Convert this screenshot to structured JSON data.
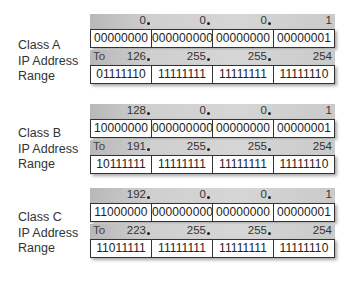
{
  "classes": [
    {
      "name": "Class A",
      "label_lines": [
        "Class A",
        "IP Address",
        "Range"
      ],
      "start": {
        "octets": [
          "0",
          "0",
          "0",
          "1"
        ],
        "binary": [
          "00000000",
          "000000000",
          "00000000",
          "00000001"
        ]
      },
      "to_label": "To",
      "end": {
        "octets": [
          "126",
          "255",
          "255",
          "254"
        ],
        "binary": [
          "01111110",
          "11111111",
          "11111111",
          "11111110"
        ]
      }
    },
    {
      "name": "Class B",
      "label_lines": [
        "Class B",
        "IP Address",
        "Range"
      ],
      "start": {
        "octets": [
          "128",
          "0",
          "0",
          "1"
        ],
        "binary": [
          "10000000",
          "000000000",
          "00000000",
          "00000001"
        ]
      },
      "to_label": "To",
      "end": {
        "octets": [
          "191",
          "255",
          "255",
          "254"
        ],
        "binary": [
          "10111111",
          "11111111",
          "11111111",
          "11111110"
        ]
      }
    },
    {
      "name": "Class C",
      "label_lines": [
        "Class C",
        "IP Address",
        "Range"
      ],
      "start": {
        "octets": [
          "192",
          "0",
          "0",
          "1"
        ],
        "binary": [
          "11000000",
          "000000000",
          "00000000",
          "00000001"
        ]
      },
      "to_label": "To",
      "end": {
        "octets": [
          "223",
          "255",
          "255",
          "254"
        ],
        "binary": [
          "11011111",
          "11111111",
          "11111111",
          "11111110"
        ]
      }
    }
  ],
  "colors": {
    "strip_dark": "#b8b8b8",
    "strip_light": "#d6d6d6",
    "border": "#333333",
    "text": "#222222"
  }
}
